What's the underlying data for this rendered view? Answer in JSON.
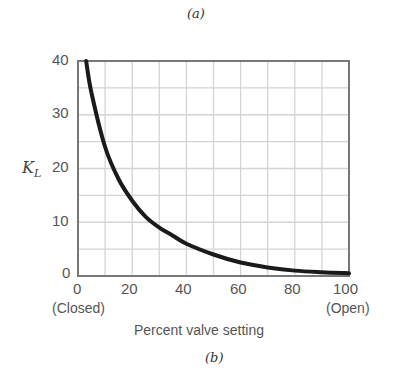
{
  "figure": {
    "top_caption": "(a)",
    "bottom_caption": "(b)"
  },
  "axes": {
    "y_label_main": "K",
    "y_label_sub": "L",
    "x_label": "Percent valve setting",
    "x_ticks": [
      "0",
      "20",
      "40",
      "60",
      "80",
      "100"
    ],
    "y_ticks": [
      "40",
      "30",
      "20",
      "10",
      "0"
    ],
    "x_left_note": "(Closed)",
    "x_right_note": "(Open)"
  },
  "chart_data": {
    "type": "line",
    "title": "",
    "xlabel": "Percent valve setting",
    "ylabel": "K_L",
    "xlim": [
      0,
      100
    ],
    "ylim": [
      0,
      40
    ],
    "grid": true,
    "x_ticks": [
      0,
      20,
      40,
      60,
      80,
      100
    ],
    "y_ticks": [
      0,
      10,
      20,
      30,
      40
    ],
    "x_tick_annotations": {
      "0": "(Closed)",
      "100": "(Open)"
    },
    "series": [
      {
        "name": "K_L",
        "x": [
          3,
          5,
          10,
          15,
          20,
          25,
          30,
          35,
          40,
          50,
          60,
          70,
          80,
          90,
          100
        ],
        "y": [
          40,
          34,
          24,
          18,
          14,
          11,
          9,
          7.5,
          6,
          4,
          2.5,
          1.6,
          1.0,
          0.7,
          0.5
        ]
      }
    ],
    "legend": null
  }
}
